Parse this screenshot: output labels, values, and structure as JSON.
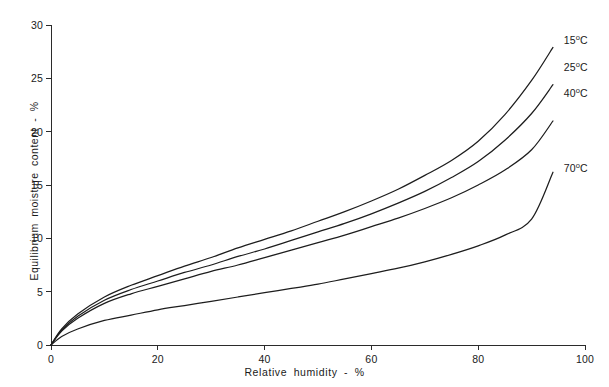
{
  "chart_data": {
    "type": "line",
    "title": "",
    "xlabel": "Relative   humidity  -  %",
    "ylabel": "Equilibrium  moisture  content -  %",
    "xlim": [
      0,
      100
    ],
    "ylim": [
      0,
      30
    ],
    "xticks": [
      0,
      20,
      40,
      60,
      80,
      100
    ],
    "yticks": [
      0,
      5,
      10,
      15,
      20,
      25,
      30
    ],
    "xticklabels": [
      "0",
      "20",
      "40",
      "60",
      "80",
      "100"
    ],
    "yticklabels": [
      "0",
      "5",
      "10",
      "15",
      "20",
      "25",
      "30"
    ],
    "grid": false,
    "legend_position": "right-of-curve-ends",
    "x": [
      0,
      2,
      5,
      10,
      15,
      20,
      25,
      30,
      35,
      40,
      45,
      50,
      55,
      60,
      65,
      70,
      75,
      80,
      85,
      90,
      94
    ],
    "series": [
      {
        "name": "15°C",
        "label_value": "15",
        "label_unit": "°C",
        "values": [
          0,
          1.5,
          2.9,
          4.5,
          5.6,
          6.5,
          7.4,
          8.2,
          9.1,
          9.9,
          10.7,
          11.6,
          12.5,
          13.5,
          14.6,
          15.9,
          17.3,
          19.1,
          21.6,
          24.8,
          27.9
        ]
      },
      {
        "name": "25°C",
        "label_value": "25",
        "label_unit": "°C",
        "values": [
          0,
          1.4,
          2.7,
          4.2,
          5.2,
          6.0,
          6.8,
          7.5,
          8.3,
          9.0,
          9.8,
          10.6,
          11.4,
          12.3,
          13.3,
          14.4,
          15.7,
          17.2,
          19.2,
          21.7,
          24.4
        ]
      },
      {
        "name": "40°C",
        "label_value": "40",
        "label_unit": "°C",
        "values": [
          0,
          1.3,
          2.5,
          3.9,
          4.8,
          5.5,
          6.2,
          6.9,
          7.5,
          8.2,
          8.9,
          9.6,
          10.3,
          11.1,
          11.9,
          12.8,
          13.8,
          15.0,
          16.4,
          18.3,
          21.0
        ]
      },
      {
        "name": "70°C",
        "label_value": "70",
        "label_unit": "°C",
        "values": [
          0,
          0.8,
          1.5,
          2.3,
          2.8,
          3.3,
          3.7,
          4.1,
          4.5,
          4.9,
          5.3,
          5.7,
          6.2,
          6.7,
          7.2,
          7.8,
          8.5,
          9.3,
          10.3,
          11.8,
          16.2
        ]
      }
    ],
    "annotations": [
      {
        "text": "15°C",
        "series": "15°C",
        "at_x": 96,
        "at_y": 28.5
      },
      {
        "text": "25°C",
        "series": "25°C",
        "at_x": 96,
        "at_y": 26.0
      },
      {
        "text": "40°C",
        "series": "40°C",
        "at_x": 96,
        "at_y": 23.5
      },
      {
        "text": "70°C",
        "series": "70°C",
        "at_x": 96,
        "at_y": 16.5
      }
    ]
  },
  "labels": {
    "xaxis": "Relative   humidity  -  %",
    "yaxis": "Equilibrium  moisture  content -  %"
  }
}
